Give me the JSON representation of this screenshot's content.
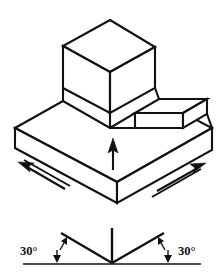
{
  "figure": {
    "colors": {
      "line": "#111111",
      "face": "#ffffff",
      "background": "#ffffff"
    },
    "solid": {
      "name": "stepped-block-with-cube",
      "parts": [
        {
          "name": "top-cube",
          "label": ""
        },
        {
          "name": "base-slab",
          "label": ""
        },
        {
          "name": "raised-step",
          "label": ""
        }
      ]
    },
    "axis_arrows": [
      {
        "name": "vertical-axis-arrow",
        "direction": "up",
        "label": ""
      },
      {
        "name": "left-axis-arrow",
        "direction": "up-left",
        "label": ""
      },
      {
        "name": "right-axis-arrow",
        "direction": "up-right",
        "label": ""
      }
    ],
    "angle_diagram": {
      "name": "thirty-degree-angle-reference",
      "baseline_label": "",
      "left_angle": "30°",
      "right_angle": "30°",
      "vertical_axis_label": ""
    }
  }
}
